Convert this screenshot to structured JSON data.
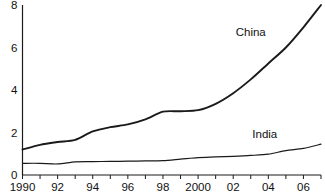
{
  "chart_data": {
    "type": "line",
    "title": "",
    "xlabel": "",
    "ylabel": "",
    "xlim": [
      1990,
      2007
    ],
    "ylim": [
      0,
      8
    ],
    "grid": false,
    "legend_position": "inline-labels",
    "x": [
      1990,
      1991,
      1992,
      1993,
      1994,
      1995,
      1996,
      1997,
      1998,
      1999,
      2000,
      2001,
      2002,
      2003,
      2004,
      2005,
      2006,
      2007
    ],
    "y_ticks": [
      0,
      2,
      4,
      6,
      8
    ],
    "y_tick_labels": [
      "0",
      "2",
      "4",
      "6",
      "8"
    ],
    "x_ticks": [
      1990,
      1991,
      1992,
      1993,
      1994,
      1995,
      1996,
      1997,
      1998,
      1999,
      2000,
      2001,
      2002,
      2003,
      2004,
      2005,
      2006,
      2007
    ],
    "x_tick_labels": [
      "1990",
      "",
      "92",
      "",
      "94",
      "",
      "96",
      "",
      "98",
      "",
      "2000",
      "",
      "02",
      "",
      "04",
      "",
      "06",
      ""
    ],
    "series": [
      {
        "name": "China",
        "color": "#1a1a1a",
        "line_width": 1.9,
        "label_x": 2003.0,
        "label_y": 6.55,
        "values": [
          1.2,
          1.42,
          1.55,
          1.65,
          2.05,
          2.25,
          2.38,
          2.62,
          2.98,
          3.0,
          3.05,
          3.35,
          3.85,
          4.5,
          5.25,
          6.0,
          6.95,
          8.0
        ]
      },
      {
        "name": "India",
        "color": "#1a1a1a",
        "line_width": 1.2,
        "label_x": 2003.8,
        "label_y": 1.75,
        "values": [
          0.55,
          0.55,
          0.52,
          0.62,
          0.63,
          0.64,
          0.65,
          0.66,
          0.68,
          0.75,
          0.82,
          0.85,
          0.88,
          0.92,
          0.98,
          1.15,
          1.25,
          1.45
        ]
      }
    ]
  }
}
